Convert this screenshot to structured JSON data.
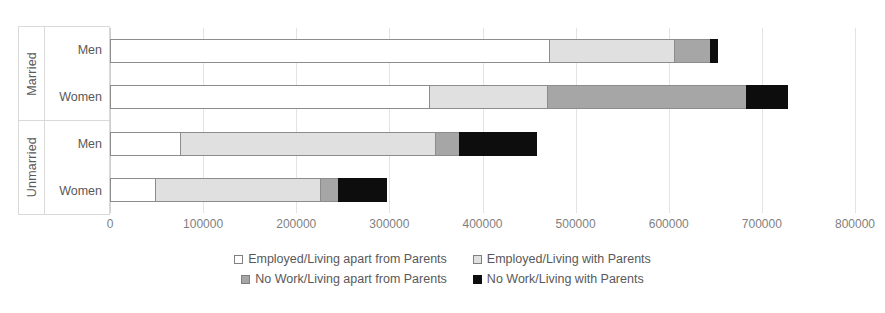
{
  "chart_data": {
    "type": "bar",
    "orientation": "horizontal",
    "stacked": true,
    "title": "",
    "subtitle": "",
    "xlabel": "",
    "ylabel": "",
    "xlim": [
      0,
      800000
    ],
    "xticks": [
      0,
      100000,
      200000,
      300000,
      400000,
      500000,
      600000,
      700000,
      800000
    ],
    "xtick_labels": [
      "0",
      "100000",
      "200000",
      "300000",
      "400000",
      "500000",
      "600000",
      "700000",
      "800000"
    ],
    "grid": true,
    "legend_position": "bottom",
    "group_labels": [
      "Married",
      "Unmarried"
    ],
    "categories": [
      "Men",
      "Women",
      "Men",
      "Women"
    ],
    "groups": [
      {
        "label": "Married",
        "categories": [
          "Men",
          "Women"
        ]
      },
      {
        "label": "Unmarried",
        "categories": [
          "Men",
          "Women"
        ]
      }
    ],
    "series": [
      {
        "name": "Employed/Living apart from Parents",
        "color": "#ffffff",
        "values": [
          473000,
          344000,
          76000,
          49000
        ]
      },
      {
        "name": "Employed/Living with Parents",
        "color": "#e0e0e0",
        "values": [
          135000,
          127000,
          275000,
          179000
        ]
      },
      {
        "name": "No Work/Living apart from Parents",
        "color": "#a6a6a6",
        "values": [
          39000,
          215000,
          27000,
          20000
        ]
      },
      {
        "name": "No Work/Living with Parents",
        "color": "#0d0d0d",
        "values": [
          9000,
          45000,
          84000,
          53000
        ]
      }
    ],
    "totals": [
      656000,
      731000,
      462000,
      301000
    ]
  },
  "legend": {
    "items": [
      {
        "label": "Employed/Living apart from Parents",
        "swatch": "s0"
      },
      {
        "label": "Employed/Living with Parents",
        "swatch": "s1"
      },
      {
        "label": "No Work/Living apart from Parents",
        "swatch": "s2"
      },
      {
        "label": "No Work/Living with Parents",
        "swatch": "s3"
      }
    ]
  }
}
